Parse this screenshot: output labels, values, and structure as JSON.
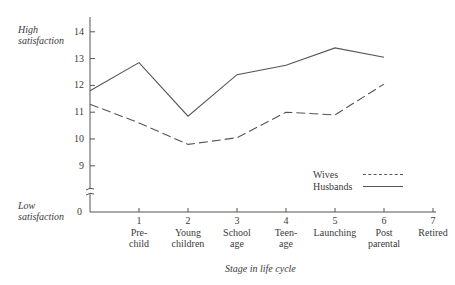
{
  "chart_data": {
    "type": "line",
    "title": "",
    "xlabel": "Stage in life cycle",
    "ylabel_high": "High satisfaction",
    "ylabel_low": "Low satisfaction",
    "x": [
      0,
      1,
      2,
      3,
      4,
      5,
      6
    ],
    "x_ticks": [
      {
        "num": "1",
        "label1": "Pre-",
        "label2": "child"
      },
      {
        "num": "2",
        "label1": "Young",
        "label2": "children"
      },
      {
        "num": "3",
        "label1": "School",
        "label2": "age"
      },
      {
        "num": "4",
        "label1": "Teen-",
        "label2": "age"
      },
      {
        "num": "5",
        "label1": "Launching",
        "label2": ""
      },
      {
        "num": "6",
        "label1": "Post",
        "label2": "parental"
      },
      {
        "num": "7",
        "label1": "Retired",
        "label2": ""
      }
    ],
    "y_ticks": [
      "14",
      "13",
      "12",
      "11",
      "10",
      "9",
      "0"
    ],
    "ylim": [
      0,
      14.5
    ],
    "axis_break": true,
    "grid": false,
    "legend_position": "lower right",
    "series": [
      {
        "name": "Wives",
        "style": "dashed",
        "values": [
          11.3,
          10.6,
          9.8,
          10.05,
          11.0,
          10.9,
          12.05
        ]
      },
      {
        "name": "Husbands",
        "style": "solid",
        "values": [
          11.8,
          12.85,
          10.85,
          12.4,
          12.75,
          13.4,
          13.05
        ]
      }
    ]
  },
  "labels": {
    "high_line1": "High",
    "high_line2": "satisfaction",
    "low_line1": "Low",
    "low_line2": "satisfaction",
    "xlabel": "Stage in life cycle"
  },
  "legend": {
    "wives": "Wives",
    "husbands": "Husbands"
  }
}
